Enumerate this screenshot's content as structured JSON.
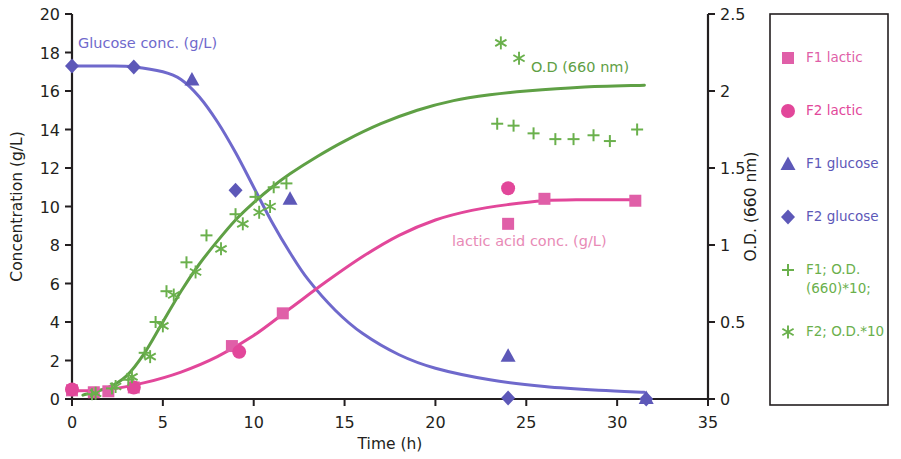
{
  "chart_data": {
    "type": "scatter",
    "title": "",
    "xlabel": "Time (h)",
    "ylabel": "Concentration (g/L)",
    "y2label": "O.D. (660 nm)",
    "xlim": [
      0,
      35
    ],
    "ylim": [
      0,
      20
    ],
    "y2lim": [
      0,
      2.5
    ],
    "xticks": [
      0,
      5,
      10,
      15,
      20,
      25,
      30,
      35
    ],
    "xtick_labels": [
      "0",
      "5",
      "10",
      "15",
      "20",
      "25",
      "30",
      "35"
    ],
    "yticks": [
      0,
      2,
      4,
      6,
      8,
      10,
      12,
      14,
      16,
      18,
      20
    ],
    "ytick_labels": [
      "0",
      "2",
      "4",
      "6",
      "8",
      "10",
      "12",
      "14",
      "16",
      "18",
      "20"
    ],
    "y2ticks": [
      0,
      0.5,
      1,
      1.5,
      2,
      2.5
    ],
    "y2tick_labels": [
      "0",
      "0.5",
      "1",
      "1.5",
      "2",
      "2.5"
    ],
    "grid": false,
    "legend_position": "right-outside",
    "series": [
      {
        "name": "F1 lactic",
        "marker": "square",
        "color": "#e05fa8",
        "axis": "left",
        "points": [
          {
            "x": 0.0,
            "y": 0.45
          },
          {
            "x": 1.2,
            "y": 0.35
          },
          {
            "x": 2.0,
            "y": 0.4
          },
          {
            "x": 3.4,
            "y": 0.6
          },
          {
            "x": 8.8,
            "y": 2.75
          },
          {
            "x": 11.6,
            "y": 4.45
          },
          {
            "x": 24.0,
            "y": 9.1
          },
          {
            "x": 26.0,
            "y": 10.4
          },
          {
            "x": 31.0,
            "y": 10.3
          }
        ]
      },
      {
        "name": "F2 lactic",
        "marker": "circle",
        "color": "#e2479a",
        "axis": "left",
        "points": [
          {
            "x": 0.0,
            "y": 0.5
          },
          {
            "x": 3.4,
            "y": 0.6
          },
          {
            "x": 9.2,
            "y": 2.45
          },
          {
            "x": 24.0,
            "y": 10.95
          }
        ]
      },
      {
        "name": "F1 glucose",
        "marker": "triangle",
        "color": "#5d58b8",
        "axis": "left",
        "points": [
          {
            "x": 6.6,
            "y": 16.6
          },
          {
            "x": 12.0,
            "y": 10.4
          },
          {
            "x": 24.0,
            "y": 2.25
          },
          {
            "x": 31.6,
            "y": 0.05
          }
        ]
      },
      {
        "name": "F2 glucose",
        "marker": "diamond",
        "color": "#5d58b8",
        "axis": "left",
        "points": [
          {
            "x": 0.0,
            "y": 17.3
          },
          {
            "x": 3.4,
            "y": 17.25
          },
          {
            "x": 9.0,
            "y": 10.85
          },
          {
            "x": 24.0,
            "y": 0.05
          },
          {
            "x": 31.6,
            "y": 0.0
          }
        ]
      },
      {
        "name": "F1; O.D. (660)*10;",
        "marker": "plus",
        "color": "#6ab04c",
        "axis": "left",
        "points": [
          {
            "x": 1.1,
            "y": 0.25
          },
          {
            "x": 2.2,
            "y": 0.55
          },
          {
            "x": 3.1,
            "y": 1.0
          },
          {
            "x": 4.0,
            "y": 2.4
          },
          {
            "x": 4.6,
            "y": 4.0
          },
          {
            "x": 5.2,
            "y": 5.6
          },
          {
            "x": 6.3,
            "y": 7.1
          },
          {
            "x": 7.4,
            "y": 8.5
          },
          {
            "x": 9.0,
            "y": 9.6
          },
          {
            "x": 10.1,
            "y": 10.5
          },
          {
            "x": 11.1,
            "y": 11.0
          },
          {
            "x": 11.8,
            "y": 11.2
          },
          {
            "x": 23.4,
            "y": 14.3
          },
          {
            "x": 24.3,
            "y": 14.2
          },
          {
            "x": 25.4,
            "y": 13.8
          },
          {
            "x": 26.6,
            "y": 13.5
          },
          {
            "x": 27.6,
            "y": 13.5
          },
          {
            "x": 28.7,
            "y": 13.7
          },
          {
            "x": 29.6,
            "y": 13.4
          },
          {
            "x": 31.1,
            "y": 14.0
          }
        ]
      },
      {
        "name": "F2; O.D.*10",
        "marker": "asterisk",
        "color": "#6ab04c",
        "axis": "left",
        "points": [
          {
            "x": 1.3,
            "y": 0.3
          },
          {
            "x": 2.4,
            "y": 0.65
          },
          {
            "x": 3.3,
            "y": 1.15
          },
          {
            "x": 4.3,
            "y": 2.2
          },
          {
            "x": 5.0,
            "y": 3.8
          },
          {
            "x": 5.6,
            "y": 5.4
          },
          {
            "x": 6.8,
            "y": 6.6
          },
          {
            "x": 8.2,
            "y": 7.8
          },
          {
            "x": 9.4,
            "y": 9.1
          },
          {
            "x": 10.3,
            "y": 9.7
          },
          {
            "x": 10.9,
            "y": 10.0
          },
          {
            "x": 23.6,
            "y": 18.5
          },
          {
            "x": 24.6,
            "y": 17.7
          }
        ]
      }
    ],
    "curves": [
      {
        "name": "Glucose conc. (g/L)",
        "color": "#6f69cc",
        "axis": "left",
        "points": [
          {
            "x": 0.0,
            "y": 17.3
          },
          {
            "x": 2.0,
            "y": 17.3
          },
          {
            "x": 3.4,
            "y": 17.25
          },
          {
            "x": 5.0,
            "y": 17.0
          },
          {
            "x": 6.0,
            "y": 16.6
          },
          {
            "x": 7.0,
            "y": 15.7
          },
          {
            "x": 8.0,
            "y": 14.4
          },
          {
            "x": 9.0,
            "y": 12.8
          },
          {
            "x": 10.0,
            "y": 11.0
          },
          {
            "x": 11.0,
            "y": 9.2
          },
          {
            "x": 12.0,
            "y": 7.6
          },
          {
            "x": 13.0,
            "y": 6.2
          },
          {
            "x": 14.5,
            "y": 4.6
          },
          {
            "x": 16.0,
            "y": 3.4
          },
          {
            "x": 18.0,
            "y": 2.3
          },
          {
            "x": 20.0,
            "y": 1.6
          },
          {
            "x": 23.0,
            "y": 1.0
          },
          {
            "x": 26.0,
            "y": 0.65
          },
          {
            "x": 29.0,
            "y": 0.45
          },
          {
            "x": 31.5,
            "y": 0.35
          }
        ]
      },
      {
        "name": "lactic acid conc. (g/L)",
        "color": "#e2479a",
        "axis": "left",
        "points": [
          {
            "x": 0.0,
            "y": 0.42
          },
          {
            "x": 2.0,
            "y": 0.5
          },
          {
            "x": 4.0,
            "y": 0.85
          },
          {
            "x": 6.0,
            "y": 1.4
          },
          {
            "x": 8.0,
            "y": 2.2
          },
          {
            "x": 10.0,
            "y": 3.3
          },
          {
            "x": 12.0,
            "y": 4.7
          },
          {
            "x": 14.0,
            "y": 6.1
          },
          {
            "x": 16.0,
            "y": 7.4
          },
          {
            "x": 18.0,
            "y": 8.5
          },
          {
            "x": 20.0,
            "y": 9.3
          },
          {
            "x": 22.0,
            "y": 9.8
          },
          {
            "x": 24.0,
            "y": 10.1
          },
          {
            "x": 26.0,
            "y": 10.3
          },
          {
            "x": 28.0,
            "y": 10.35
          },
          {
            "x": 31.2,
            "y": 10.35
          }
        ]
      },
      {
        "name": "O.D (660 nm)",
        "color": "#5fa045",
        "axis": "left",
        "points": [
          {
            "x": 0.6,
            "y": 0.2
          },
          {
            "x": 2.0,
            "y": 0.6
          },
          {
            "x": 3.0,
            "y": 1.2
          },
          {
            "x": 4.0,
            "y": 2.4
          },
          {
            "x": 5.0,
            "y": 4.0
          },
          {
            "x": 6.0,
            "y": 5.6
          },
          {
            "x": 7.0,
            "y": 7.0
          },
          {
            "x": 8.0,
            "y": 8.2
          },
          {
            "x": 9.0,
            "y": 9.3
          },
          {
            "x": 10.0,
            "y": 10.2
          },
          {
            "x": 11.0,
            "y": 11.0
          },
          {
            "x": 12.0,
            "y": 11.7
          },
          {
            "x": 13.5,
            "y": 12.6
          },
          {
            "x": 15.0,
            "y": 13.4
          },
          {
            "x": 17.0,
            "y": 14.3
          },
          {
            "x": 19.0,
            "y": 15.0
          },
          {
            "x": 21.0,
            "y": 15.5
          },
          {
            "x": 23.0,
            "y": 15.8
          },
          {
            "x": 25.0,
            "y": 16.0
          },
          {
            "x": 28.0,
            "y": 16.2
          },
          {
            "x": 31.5,
            "y": 16.3
          }
        ]
      }
    ],
    "annotations": [
      {
        "text": "Glucose conc. (g/L)",
        "x_px": 78,
        "y_px": 48,
        "color": "#6f69cc"
      },
      {
        "text": "O.D (660 nm)",
        "x_px": 531,
        "y_px": 72,
        "color": "#5fa045"
      },
      {
        "text": "lactic acid conc. (g/L)",
        "x_px": 452,
        "y_px": 246,
        "color": "#e88ab6"
      }
    ]
  },
  "legend": {
    "items": [
      {
        "label": "F1 lactic",
        "marker": "square",
        "color": "#e05fa8"
      },
      {
        "label": "F2 lactic",
        "marker": "circle",
        "color": "#e2479a"
      },
      {
        "label": "F1 glucose",
        "marker": "triangle",
        "color": "#5d58b8"
      },
      {
        "label": "F2 glucose",
        "marker": "diamond",
        "color": "#5d58b8"
      },
      {
        "label": "F1; O.D.",
        "label2": "(660)*10;",
        "marker": "plus",
        "color": "#6ab04c"
      },
      {
        "label": "F2; O.D.*10",
        "marker": "asterisk",
        "color": "#6ab04c"
      }
    ]
  }
}
